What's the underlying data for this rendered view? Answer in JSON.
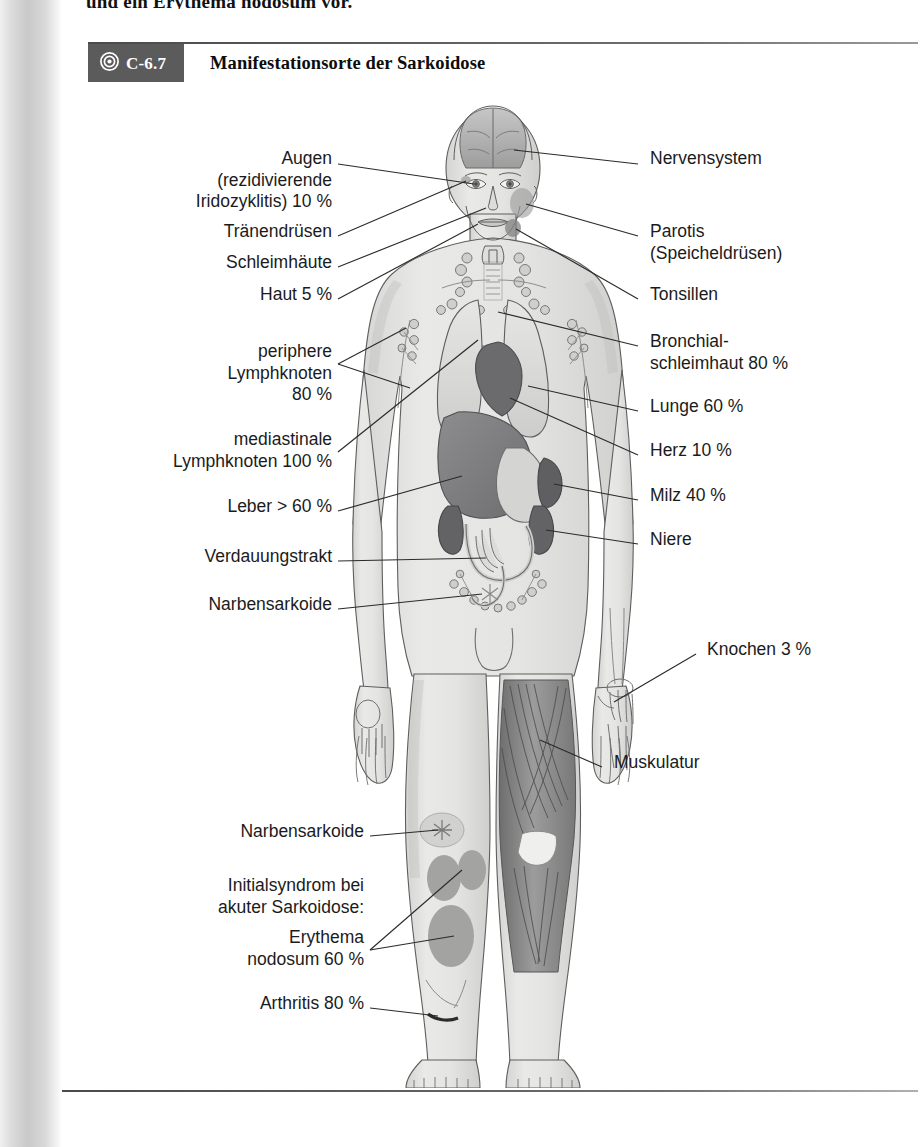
{
  "page": {
    "running_text": "und ein Erythema nodosum vor."
  },
  "figure": {
    "number": "C-6.7",
    "badge_icon": "target-icon",
    "title": "Manifestationsorte der Sarkoidose",
    "illustration_name": "human-body-sarcoidosis-diagram"
  },
  "labels_left": [
    {
      "id": "augen",
      "text": "Augen\n(rezidivierende\nIridozyklitis) 10 %",
      "x": 32,
      "y": 68,
      "align": "right",
      "w": 238
    },
    {
      "id": "traenendruesen",
      "text": "Tränendrüsen",
      "x": 32,
      "y": 140,
      "align": "right",
      "w": 238
    },
    {
      "id": "schleimhaeute",
      "text": "Schleimhäute",
      "x": 32,
      "y": 171,
      "align": "right",
      "w": 238
    },
    {
      "id": "haut",
      "text": "Haut 5 %",
      "x": 32,
      "y": 203,
      "align": "right",
      "w": 238
    },
    {
      "id": "periphere-lk",
      "text": "periphere\nLymphknoten\n80 %",
      "x": 32,
      "y": 260,
      "align": "right",
      "w": 238
    },
    {
      "id": "mediastinale-lk",
      "text": "mediastinale\nLymphknoten 100 %",
      "x": 6,
      "y": 348,
      "align": "right",
      "w": 264
    },
    {
      "id": "leber",
      "text": "Leber > 60 %",
      "x": 32,
      "y": 415,
      "align": "right",
      "w": 238
    },
    {
      "id": "verdauungstrakt",
      "text": "Verdauungstrakt",
      "x": 32,
      "y": 465,
      "align": "right",
      "w": 238
    },
    {
      "id": "narbensarkoide-1",
      "text": "Narbensarkoide",
      "x": 32,
      "y": 513,
      "align": "right",
      "w": 238
    },
    {
      "id": "narbensarkoide-2",
      "text": "Narbensarkoide",
      "x": 32,
      "y": 740,
      "align": "right",
      "w": 270
    },
    {
      "id": "initialsyndrom",
      "text": "Initialsyndrom bei\nakuter Sarkoidose:",
      "x": 32,
      "y": 794,
      "align": "right",
      "w": 270
    },
    {
      "id": "erythema-nodosum",
      "text": "Erythema\nnodosum 60 %",
      "x": 32,
      "y": 846,
      "align": "right",
      "w": 270
    },
    {
      "id": "arthritis",
      "text": "Arthritis 80 %",
      "x": 32,
      "y": 912,
      "align": "right",
      "w": 270
    }
  ],
  "labels_right": [
    {
      "id": "nervensystem",
      "text": "Nervensystem",
      "x": 588,
      "y": 68,
      "align": "left"
    },
    {
      "id": "parotis",
      "text": "Parotis\n(Speicheldrüsen)",
      "x": 588,
      "y": 140,
      "align": "left"
    },
    {
      "id": "tonsillen",
      "text": "Tonsillen",
      "x": 588,
      "y": 203,
      "align": "left"
    },
    {
      "id": "bronchial",
      "text": "Bronchial-\nschleimhaut 80 %",
      "x": 588,
      "y": 250,
      "align": "left"
    },
    {
      "id": "lunge",
      "text": "Lunge 60 %",
      "x": 588,
      "y": 315,
      "align": "left"
    },
    {
      "id": "herz",
      "text": "Herz 10 %",
      "x": 588,
      "y": 359,
      "align": "left"
    },
    {
      "id": "milz",
      "text": "Milz 40 %",
      "x": 588,
      "y": 404,
      "align": "left"
    },
    {
      "id": "niere",
      "text": "Niere",
      "x": 588,
      "y": 448,
      "align": "left"
    },
    {
      "id": "knochen",
      "text": "Knochen 3 %",
      "x": 645,
      "y": 558,
      "align": "left"
    },
    {
      "id": "muskulatur",
      "text": "Muskulatur",
      "x": 552,
      "y": 671,
      "align": "left"
    }
  ],
  "colors": {
    "badge_bg": "#5b5b5b",
    "rule": "#4a4a4a",
    "text": "#1b1b1b",
    "skin": "#e3e3e1",
    "organ_dark": "#6f6f70",
    "organ_mid": "#a9a9aa",
    "organ_light": "#d2d2d0",
    "muscle": "#8e8e8e",
    "leader": "#2b2b2b"
  }
}
